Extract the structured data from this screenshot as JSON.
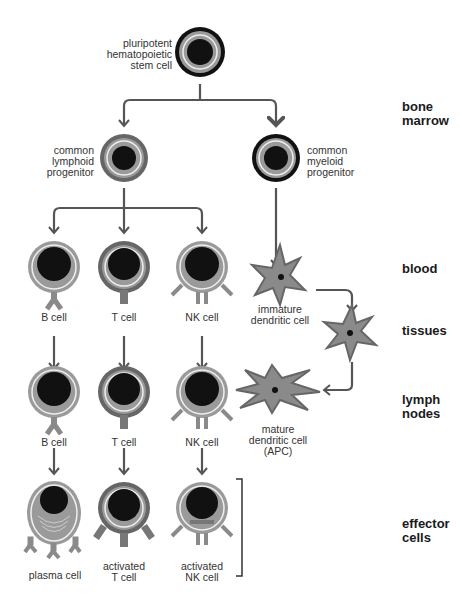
{
  "diagram": {
    "zones": {
      "bone_marrow": "bone\nmarrow",
      "blood": "blood",
      "tissues": "tissues",
      "lymph_nodes": "lymph\nnodes",
      "effector_cells": "effector\ncells"
    },
    "cells": {
      "stem": "pluripotent\nhematopoietic\nstem cell",
      "lymphoid": "common\nlymphoid\nprogenitor",
      "myeloid": "common\nmyeloid\nprogenitor",
      "b_cell_blood": "B cell",
      "t_cell_blood": "T cell",
      "nk_cell_blood": "NK cell",
      "immature_dc": "immature\ndendritic cell",
      "b_cell_lymph": "B cell",
      "t_cell_lymph": "T cell",
      "nk_cell_lymph": "NK cell",
      "mature_dc": "mature\ndendritic cell\n(APC)",
      "plasma_cell": "plasma cell",
      "activated_t": "activated\nT cell",
      "activated_nk": "activated\nNK cell"
    },
    "colors": {
      "nucleus": "#111111",
      "cytoplasm": "#9a9a9a",
      "membrane_light": "#f0f0f0",
      "ring_dark": "#111111",
      "ring_mid": "#666666",
      "arrow": "#555555",
      "receptor": "#8a8a8a"
    }
  }
}
